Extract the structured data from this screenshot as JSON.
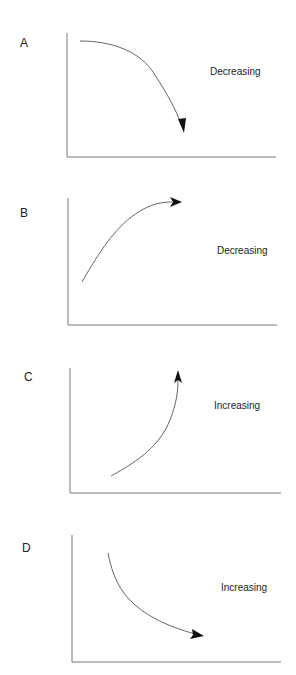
{
  "panels": [
    {
      "id": "A",
      "label": "A",
      "trend": "Decreasing",
      "curve_shape": "concave-down, decreasing, arrow pointing down-right"
    },
    {
      "id": "B",
      "label": "B",
      "trend": "Decreasing",
      "curve_shape": "concave-down, increasing, arrow pointing right"
    },
    {
      "id": "C",
      "label": "C",
      "trend": "Increasing",
      "curve_shape": "concave-up, increasing, arrow pointing up"
    },
    {
      "id": "D",
      "label": "D",
      "trend": "Increasing",
      "curve_shape": "concave-up, decreasing, arrow pointing right"
    }
  ],
  "colors": {
    "axis": "#777777",
    "curve": "#666666",
    "arrowhead": "#111111",
    "text": "#222222",
    "background": "#ffffff"
  }
}
